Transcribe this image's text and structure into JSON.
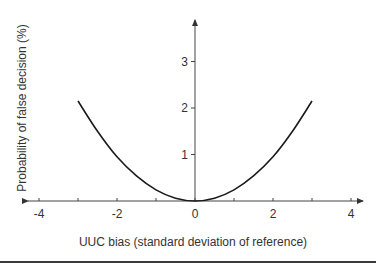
{
  "chart_data": {
    "type": "line",
    "title": "",
    "xlabel": "UUC bias (standard deviation of reference)",
    "ylabel": "Probability of false decision (%)",
    "xlim": [
      -4,
      4
    ],
    "ylim": [
      0,
      3.5
    ],
    "x_ticks": [
      -4,
      -3,
      -2,
      -1,
      0,
      1,
      2,
      3,
      4
    ],
    "x_tick_labels": [
      "-4",
      "",
      "-2",
      "",
      "0",
      "",
      "2",
      "",
      "4"
    ],
    "y_ticks": [
      1,
      2,
      3
    ],
    "y_tick_labels": [
      "1",
      "2",
      "3"
    ],
    "grid": false,
    "legend": null,
    "series": [
      {
        "name": "Probability of false decision",
        "x": [
          -3,
          -2.5,
          -2,
          -1.5,
          -1,
          -0.5,
          0,
          0.5,
          1,
          1.5,
          2,
          2.5,
          3
        ],
        "values": [
          2.15,
          1.5,
          0.95,
          0.54,
          0.24,
          0.06,
          0,
          0.06,
          0.24,
          0.54,
          0.95,
          1.5,
          2.15
        ]
      }
    ]
  }
}
